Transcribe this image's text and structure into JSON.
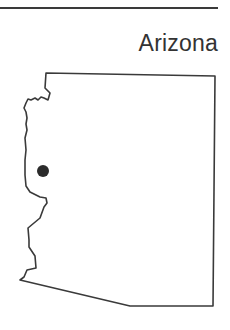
{
  "header": {
    "title": "Arizona"
  },
  "map": {
    "region": "Arizona",
    "outline_color": "#3a3a3a",
    "marker": {
      "x": 43,
      "y": 171,
      "r": 6,
      "color": "#2b2b2b"
    }
  }
}
